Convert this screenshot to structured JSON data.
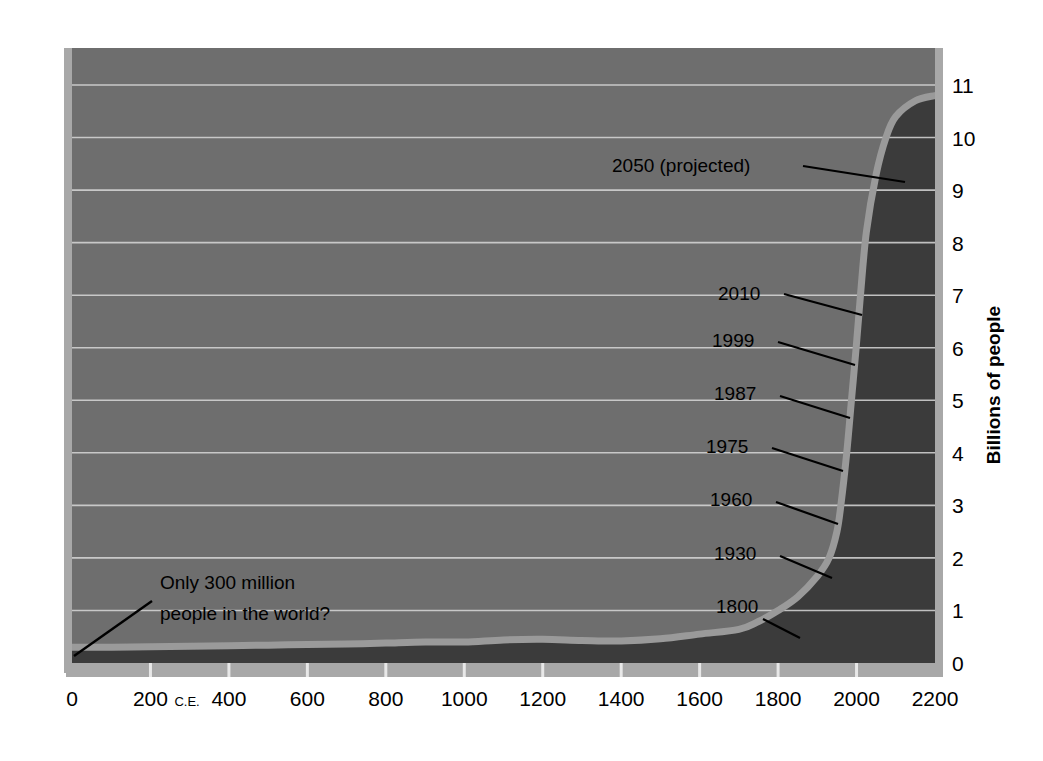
{
  "chart_data": {
    "type": "area",
    "title": "",
    "subtitle": "",
    "xlabel": "",
    "ylabel": "Billions of people",
    "xlim": [
      0,
      2200
    ],
    "ylim": [
      0,
      11
    ],
    "grid": true,
    "legend": "none",
    "x_ticks": [
      {
        "value": 0,
        "label": "0",
        "suffix": ""
      },
      {
        "value": 200,
        "label": "200",
        "suffix": "C.E."
      },
      {
        "value": 400,
        "label": "400",
        "suffix": ""
      },
      {
        "value": 600,
        "label": "600",
        "suffix": ""
      },
      {
        "value": 800,
        "label": "800",
        "suffix": ""
      },
      {
        "value": 1000,
        "label": "1000",
        "suffix": ""
      },
      {
        "value": 1200,
        "label": "1200",
        "suffix": ""
      },
      {
        "value": 1400,
        "label": "1400",
        "suffix": ""
      },
      {
        "value": 1600,
        "label": "1600",
        "suffix": ""
      },
      {
        "value": 1800,
        "label": "1800",
        "suffix": ""
      },
      {
        "value": 2000,
        "label": "2000",
        "suffix": ""
      },
      {
        "value": 2200,
        "label": "2200",
        "suffix": ""
      }
    ],
    "y_ticks": [
      {
        "value": 0,
        "label": "0"
      },
      {
        "value": 1,
        "label": "1"
      },
      {
        "value": 2,
        "label": "2"
      },
      {
        "value": 3,
        "label": "3"
      },
      {
        "value": 4,
        "label": "4"
      },
      {
        "value": 5,
        "label": "5"
      },
      {
        "value": 6,
        "label": "6"
      },
      {
        "value": 7,
        "label": "7"
      },
      {
        "value": 8,
        "label": "8"
      },
      {
        "value": 9,
        "label": "9"
      },
      {
        "value": 10,
        "label": "10"
      },
      {
        "value": 11,
        "label": "11"
      }
    ],
    "series": [
      {
        "name": "World population",
        "x": [
          0,
          100,
          200,
          300,
          400,
          500,
          600,
          700,
          800,
          900,
          1000,
          1100,
          1200,
          1300,
          1400,
          1500,
          1600,
          1700,
          1750,
          1800,
          1850,
          1900,
          1930,
          1950,
          1960,
          1975,
          1987,
          1999,
          2010,
          2025,
          2050,
          2075,
          2100,
          2150,
          2200
        ],
        "y": [
          0.3,
          0.3,
          0.31,
          0.32,
          0.33,
          0.34,
          0.35,
          0.36,
          0.38,
          0.4,
          0.4,
          0.44,
          0.45,
          0.43,
          0.42,
          0.46,
          0.55,
          0.64,
          0.79,
          1.0,
          1.26,
          1.65,
          2.0,
          2.5,
          3.0,
          4.0,
          5.0,
          6.0,
          7.0,
          8.2,
          9.3,
          10.0,
          10.4,
          10.7,
          10.8
        ]
      }
    ],
    "projection_start_year": 2010,
    "historical_fill_color": "#3b3b3b",
    "projected_fill_color": "#6e6e6e",
    "curve_stroke_color": "#9a9a9a",
    "gridline_color": "#c8c8c8",
    "axis_color": "#a8a8a8",
    "background_color": "#ffffff",
    "annotations": [
      {
        "id": "a2050",
        "text": "2050 (projected)",
        "year": 2050,
        "value": 9.3,
        "text_x": 612,
        "text_y": 172,
        "anchor": "start",
        "leader": [
          [
            803,
            166
          ],
          [
            905,
            182
          ]
        ]
      },
      {
        "id": "a2010",
        "text": "2010",
        "year": 2010,
        "value": 7,
        "text_x": 718,
        "text_y": 300,
        "anchor": "start",
        "leader": [
          [
            784,
            294
          ],
          [
            862,
            315
          ]
        ]
      },
      {
        "id": "a1999",
        "text": "1999",
        "year": 1999,
        "value": 6,
        "text_x": 712,
        "text_y": 347,
        "anchor": "start",
        "leader": [
          [
            778,
            342
          ],
          [
            855,
            365
          ]
        ]
      },
      {
        "id": "a1987",
        "text": "1987",
        "year": 1987,
        "value": 5,
        "text_x": 714,
        "text_y": 400,
        "anchor": "start",
        "leader": [
          [
            780,
            396
          ],
          [
            850,
            418
          ]
        ]
      },
      {
        "id": "a1975",
        "text": "1975",
        "year": 1975,
        "value": 4,
        "text_x": 706,
        "text_y": 453,
        "anchor": "start",
        "leader": [
          [
            772,
            448
          ],
          [
            843,
            471
          ]
        ]
      },
      {
        "id": "a1960",
        "text": "1960",
        "year": 1960,
        "value": 3,
        "text_x": 710,
        "text_y": 506,
        "anchor": "start",
        "leader": [
          [
            776,
            502
          ],
          [
            838,
            524
          ]
        ]
      },
      {
        "id": "a1930",
        "text": "1930",
        "year": 1930,
        "value": 2,
        "text_x": 714,
        "text_y": 560,
        "anchor": "start",
        "leader": [
          [
            780,
            556
          ],
          [
            832,
            578
          ]
        ]
      },
      {
        "id": "a1800",
        "text": "1800",
        "year": 1800,
        "value": 1,
        "text_x": 716,
        "text_y": 613,
        "anchor": "start",
        "leader": [
          [
            763,
            619
          ],
          [
            800,
            638
          ]
        ]
      }
    ],
    "callout": {
      "id": "callout-300-million",
      "line1": "Only 300 million",
      "line2": "people in the world?",
      "text_x": 160,
      "text_y1": 589,
      "text_y2": 620,
      "leader": [
        [
          152,
          601
        ],
        [
          74,
          656
        ]
      ]
    }
  }
}
